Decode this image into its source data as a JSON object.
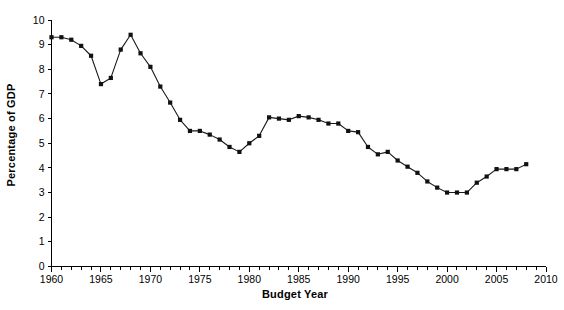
{
  "chart_data": {
    "type": "line",
    "title": "",
    "xlabel": "Budget Year",
    "ylabel": "Percentage of GDP",
    "xlim": [
      1960,
      2010
    ],
    "ylim": [
      0,
      10
    ],
    "grid": false,
    "legend": null,
    "x_major_ticks": [
      1960,
      1965,
      1970,
      1975,
      1980,
      1985,
      1990,
      1995,
      2000,
      2005,
      2010
    ],
    "x_minor_tick_step": 1,
    "x_tick_labels": [
      "1960",
      "1965",
      "1970",
      "1975",
      "1980",
      "1985",
      "1990",
      "1995",
      "2000",
      "2005",
      "2010"
    ],
    "y_ticks": [
      0,
      1,
      2,
      3,
      4,
      5,
      6,
      7,
      8,
      9,
      10
    ],
    "y_tick_labels": [
      "0",
      "1",
      "2",
      "3",
      "4",
      "5",
      "6",
      "7",
      "8",
      "9",
      "10"
    ],
    "marker": "square",
    "line_color": "#1a1a1a",
    "x": [
      1960,
      1961,
      1962,
      1963,
      1964,
      1965,
      1966,
      1967,
      1968,
      1969,
      1970,
      1971,
      1972,
      1973,
      1974,
      1975,
      1976,
      1977,
      1978,
      1979,
      1980,
      1981,
      1982,
      1983,
      1984,
      1985,
      1986,
      1987,
      1988,
      1989,
      1990,
      1991,
      1992,
      1993,
      1994,
      1995,
      1996,
      1997,
      1998,
      1999,
      2000,
      2001,
      2002,
      2003,
      2004,
      2005,
      2006,
      2007,
      2008
    ],
    "values": [
      9.3,
      9.3,
      9.2,
      8.95,
      8.55,
      7.4,
      7.65,
      8.8,
      9.4,
      8.65,
      8.1,
      7.3,
      6.65,
      5.95,
      5.5,
      5.5,
      5.35,
      5.15,
      4.85,
      4.65,
      5.0,
      5.3,
      6.05,
      6.0,
      5.95,
      6.1,
      6.05,
      5.95,
      5.8,
      5.8,
      5.5,
      5.45,
      4.85,
      4.55,
      4.65,
      4.3,
      4.05,
      3.8,
      3.45,
      3.2,
      3.0,
      3.0,
      3.0,
      3.4,
      3.65,
      3.95,
      3.95,
      3.95,
      4.15
    ],
    "series_name": "Defense outlays as percentage of GDP"
  }
}
